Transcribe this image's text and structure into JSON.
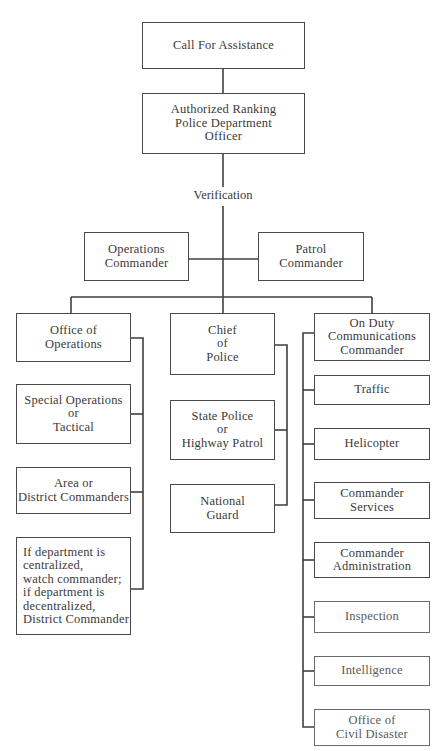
{
  "diagram": {
    "type": "organizational-flowchart",
    "nodes": {
      "call": "Call For Assistance",
      "authorized": "Authorized Ranking\nPolice Department\nOfficer",
      "verification": "Verification",
      "operations_commander": "Operations\nCommander",
      "patrol_commander": "Patrol\nCommander",
      "office_of_operations": "Office of\nOperations",
      "chief_of_police": "Chief\nof\nPolice",
      "on_duty": "On Duty\nCommunications\nCommander",
      "special_operations": "Special Operations\nor\nTactical",
      "area_district": "Area or\nDistrict Commanders",
      "if_department": "If department is\ncentralized,\nwatch commander;\nif department is\ndecentralized,\nDistrict Commander",
      "state_police": "State Police\nor\nHighway Patrol",
      "national_guard": "National\nGuard",
      "traffic": "Traffic",
      "helicopter": "Helicopter",
      "commander_services": "Commander\nServices",
      "commander_administration": "Commander\nAdministration",
      "inspection": "Inspection",
      "intelligence": "Intelligence",
      "office_civil_disaster": "Office of\nCivil Disaster"
    },
    "edges": [
      [
        "call",
        "authorized"
      ],
      [
        "authorized",
        "verification"
      ],
      [
        "verification",
        "operations_commander"
      ],
      [
        "verification",
        "patrol_commander"
      ],
      [
        "verification",
        "office_of_operations"
      ],
      [
        "verification",
        "chief_of_police"
      ],
      [
        "verification",
        "on_duty"
      ],
      [
        "office_of_operations",
        "special_operations"
      ],
      [
        "office_of_operations",
        "area_district"
      ],
      [
        "office_of_operations",
        "if_department"
      ],
      [
        "chief_of_police",
        "state_police"
      ],
      [
        "chief_of_police",
        "national_guard"
      ],
      [
        "on_duty",
        "traffic"
      ],
      [
        "on_duty",
        "helicopter"
      ],
      [
        "on_duty",
        "commander_services"
      ],
      [
        "on_duty",
        "commander_administration"
      ],
      [
        "on_duty",
        "inspection"
      ],
      [
        "on_duty",
        "intelligence"
      ],
      [
        "on_duty",
        "office_civil_disaster"
      ]
    ]
  }
}
